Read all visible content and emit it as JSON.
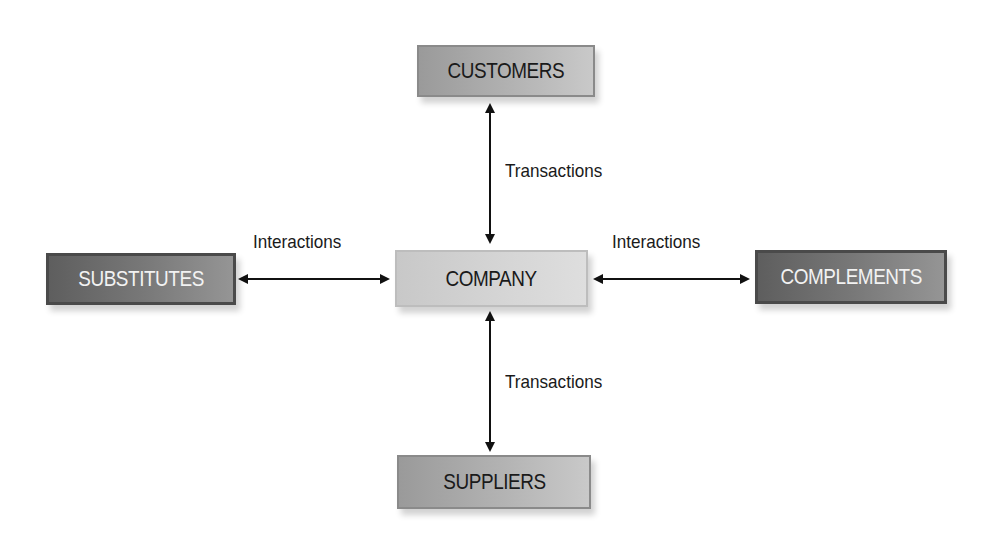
{
  "diagram": {
    "nodes": {
      "customers": {
        "label": "CUSTOMERS",
        "style": "medium-gray"
      },
      "substitutes": {
        "label": "SUBSTITUTES",
        "style": "dark-gray"
      },
      "company": {
        "label": "COMPANY",
        "style": "light-gray"
      },
      "complements": {
        "label": "COMPLEMENTS",
        "style": "dark-gray"
      },
      "suppliers": {
        "label": "SUPPLIERS",
        "style": "medium-gray"
      }
    },
    "edges": [
      {
        "from": "company",
        "to": "customers",
        "label": "Transactions",
        "direction": "bidirectional"
      },
      {
        "from": "company",
        "to": "suppliers",
        "label": "Transactions",
        "direction": "bidirectional"
      },
      {
        "from": "company",
        "to": "substitutes",
        "label": "Interactions",
        "direction": "bidirectional"
      },
      {
        "from": "company",
        "to": "complements",
        "label": "Interactions",
        "direction": "bidirectional"
      }
    ],
    "edge_labels": {
      "top": "Transactions",
      "bottom": "Transactions",
      "left": "Interactions",
      "right": "Interactions"
    },
    "colors": {
      "dark_box": "#6b6b6b",
      "medium_box": "#a8a8a8",
      "light_box": "#d2d2d2",
      "arrow": "#111111"
    }
  }
}
